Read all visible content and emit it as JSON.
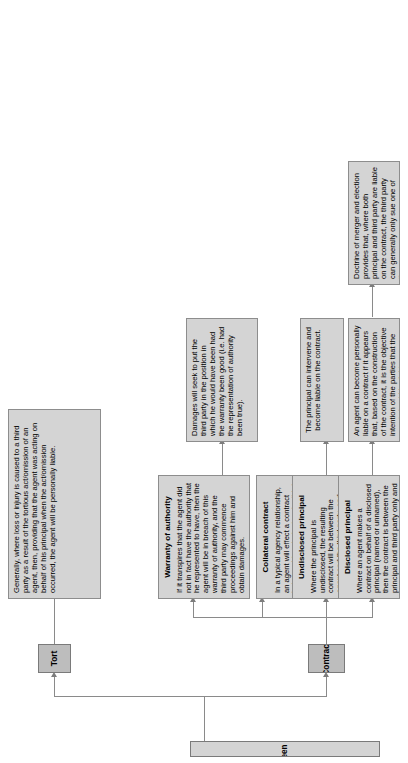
{
  "diagram": {
    "title": "Legal relations between agent and third party",
    "branches": [
      {
        "key": "tort",
        "label": "Tort"
      },
      {
        "key": "contract",
        "label": "Contract"
      }
    ],
    "nodes": {
      "tort_detail": {
        "header": "",
        "body": "Generally, where loss or injury is caused to a third party as a result of the tortious act/omission of an agent, then, providing that the agent was acting on behalf of his principal when the act/omission occurred, the agent will be personally liable."
      },
      "warranty_of_authority": {
        "header": "Warranty of authority",
        "body": "If it transpires that the agent did not in fact have the authority that he represented to have, then the agent will be in breach of this warranty of authority, and the third party may commence proceedings against him and obtain damages."
      },
      "warranty_damages": {
        "header": "",
        "body": "Damages will seek to put the third party in the position in which he would have been had the warranty been good (i.e. had the representation of authority been true)."
      },
      "collateral_contract": {
        "header": "Collateral contract",
        "body": "In a typical agency relationship, an agent will effect a contract between his principal and a third party. The agent is not a party to this contract and is not usually liable on it. In certain circum-stances, however, the courts may hold that a separate collateral contract exists between the agent and the third party, upon which either party can be liable."
      },
      "undisclosed_principal": {
        "header": "Undisclosed principal",
        "body": "Where the principal is undisclosed, the resulting contract will be between the agent and the third party, and both parties can sue, and be sued, on it."
      },
      "undisclosed_intervene": {
        "header": "",
        "body": "The principal can intervene and become liable on the contract."
      },
      "disclosed_principal": {
        "header": "Disclosed principal",
        "body": "Where an agent makes a contract on behalf of a disclosed principal (named or unnamed), then the contract is between the principal and third party only and the agent cannot sue the third party, nor can he be sued by the third party."
      },
      "agent_personally_liable": {
        "header": "",
        "body": "An agent can become personally liable on a contract if it appears that, based on the construction of the contract, it is the objective intention of the parties that the agent should be liable."
      },
      "doctrine_of_merger": {
        "header": "",
        "body": "Doctrine of merger and election provides that, where both principal and third party are liable on the contract, the third party can generally only sue one of them."
      }
    },
    "colors": {
      "box_fill": "#d4d4d4",
      "category_fill": "#bdbdbd",
      "border": "#8d8d8d",
      "connector": "#8a8a8a",
      "text": "#000000"
    }
  }
}
